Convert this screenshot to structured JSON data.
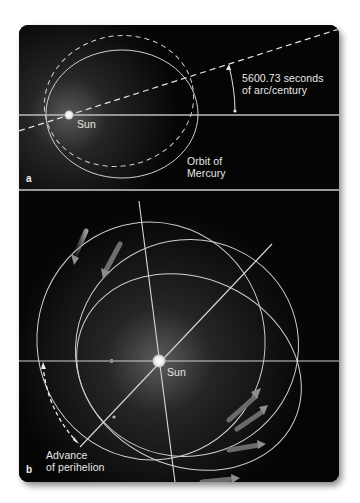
{
  "figure": {
    "panel_a": {
      "letter": "a",
      "sun_label": "Sun",
      "angle_label_line1": "5600.73 seconds",
      "angle_label_line2": "of arc/century",
      "orbit_label_line1": "Orbit of",
      "orbit_label_line2": "Mercury"
    },
    "panel_b": {
      "letter": "b",
      "sun_label": "Sun",
      "advance_label_line1": "Advance",
      "advance_label_line2": "of perihelion"
    },
    "colors": {
      "background": "#050505",
      "line": "#d8d8d8",
      "separator": "#9a9a9a",
      "sun": "#f4f4f4",
      "arrow": "#8a8a8a"
    }
  }
}
